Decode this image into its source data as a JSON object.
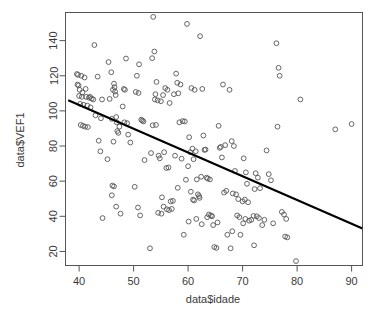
{
  "chart_data": {
    "type": "scatter",
    "title": "",
    "xlabel": "data$idade",
    "ylabel": "data$VEF1",
    "xlim": [
      37.5,
      92.0
    ],
    "ylim": [
      12.0,
      156.0
    ],
    "xticks": [
      40,
      50,
      60,
      70,
      80,
      90
    ],
    "yticks": [
      20,
      40,
      60,
      80,
      100,
      120,
      140
    ],
    "grid": false,
    "legend": null,
    "marker": {
      "shape": "open-circle",
      "radius": 2.4,
      "color": "#555555",
      "stroke_width": 0.9
    },
    "regression_line": {
      "x0": 38.0,
      "y0": 106.0,
      "x1": 92.0,
      "y1": 33.0,
      "color": "#000000",
      "width": 2.2,
      "slope": -1.352,
      "intercept": 157.4
    },
    "box": {
      "color": "#555555",
      "width": 1.0
    },
    "n_points": 201,
    "points": [
      [
        39.6,
        121.0
      ],
      [
        39.8,
        120.5
      ],
      [
        40.4,
        120.0
      ],
      [
        41.0,
        119.0
      ],
      [
        39.7,
        115.0
      ],
      [
        39.9,
        114.5
      ],
      [
        40.1,
        112.0
      ],
      [
        40.6,
        110.5
      ],
      [
        41.2,
        112.5
      ],
      [
        40.0,
        108.5
      ],
      [
        40.5,
        108.0
      ],
      [
        41.3,
        108.0
      ],
      [
        41.8,
        107.5
      ],
      [
        42.0,
        108.0
      ],
      [
        42.3,
        107.0
      ],
      [
        42.6,
        106.5
      ],
      [
        40.2,
        104.0
      ],
      [
        40.8,
        103.5
      ],
      [
        41.5,
        103.0
      ],
      [
        42.1,
        102.0
      ],
      [
        40.3,
        92.0
      ],
      [
        40.7,
        91.5
      ],
      [
        41.1,
        91.0
      ],
      [
        41.6,
        90.8
      ],
      [
        42.8,
        137.5
      ],
      [
        43.4,
        119.5
      ],
      [
        44.2,
        106.5
      ],
      [
        43.0,
        97.5
      ],
      [
        44.0,
        95.8
      ],
      [
        43.6,
        83.0
      ],
      [
        43.9,
        77.0
      ],
      [
        44.3,
        39.0
      ],
      [
        45.4,
        127.8
      ],
      [
        45.9,
        122.0
      ],
      [
        46.2,
        112.0
      ],
      [
        46.4,
        115.5
      ],
      [
        46.5,
        113.5
      ],
      [
        46.6,
        111.0
      ],
      [
        46.7,
        109.0
      ],
      [
        45.6,
        106.8
      ],
      [
        46.8,
        96.5
      ],
      [
        46.0,
        95.5
      ],
      [
        46.9,
        93.5
      ],
      [
        47.4,
        91.0
      ],
      [
        47.0,
        88.5
      ],
      [
        47.2,
        87.5
      ],
      [
        46.3,
        82.5
      ],
      [
        45.2,
        72.5
      ],
      [
        46.1,
        57.5
      ],
      [
        46.4,
        57.0
      ],
      [
        46.0,
        52.0
      ],
      [
        46.8,
        45.5
      ],
      [
        47.6,
        41.5
      ],
      [
        48.6,
        129.8
      ],
      [
        48.2,
        112.5
      ],
      [
        48.4,
        112.0
      ],
      [
        48.0,
        102.5
      ],
      [
        48.3,
        93.5
      ],
      [
        48.8,
        93.0
      ],
      [
        49.0,
        86.5
      ],
      [
        49.4,
        82.0
      ],
      [
        50.2,
        56.8
      ],
      [
        50.8,
        45.0
      ],
      [
        51.2,
        40.5
      ],
      [
        51.0,
        126.5
      ],
      [
        50.6,
        120.0
      ],
      [
        50.4,
        110.8
      ],
      [
        50.9,
        110.2
      ],
      [
        51.4,
        95.0
      ],
      [
        51.6,
        94.5
      ],
      [
        51.8,
        94.0
      ],
      [
        52.0,
        72.0
      ],
      [
        53.6,
        153.5
      ],
      [
        53.8,
        133.8
      ],
      [
        53.4,
        130.0
      ],
      [
        54.2,
        116.5
      ],
      [
        54.0,
        109.5
      ],
      [
        53.9,
        106.5
      ],
      [
        54.4,
        106.0
      ],
      [
        53.5,
        91.8
      ],
      [
        54.1,
        92.0
      ],
      [
        53.2,
        76.0
      ],
      [
        54.6,
        74.5
      ],
      [
        54.8,
        73.0
      ],
      [
        53.0,
        21.8
      ],
      [
        55.4,
        109.0
      ],
      [
        55.8,
        113.0
      ],
      [
        56.2,
        112.0
      ],
      [
        55.0,
        105.5
      ],
      [
        56.6,
        104.5
      ],
      [
        55.6,
        76.5
      ],
      [
        56.0,
        67.5
      ],
      [
        56.4,
        67.8
      ],
      [
        55.2,
        50.8
      ],
      [
        56.8,
        48.5
      ],
      [
        55.5,
        45.5
      ],
      [
        56.1,
        44.0
      ],
      [
        56.5,
        43.5
      ],
      [
        57.0,
        44.2
      ],
      [
        54.5,
        42.0
      ],
      [
        55.1,
        41.5
      ],
      [
        57.4,
        109.5
      ],
      [
        57.8,
        121.2
      ],
      [
        58.0,
        116.0
      ],
      [
        58.6,
        115.0
      ],
      [
        58.2,
        110.0
      ],
      [
        59.0,
        94.2
      ],
      [
        59.4,
        94.0
      ],
      [
        58.4,
        93.5
      ],
      [
        57.6,
        74.5
      ],
      [
        58.8,
        72.8
      ],
      [
        59.6,
        60.8
      ],
      [
        58.1,
        56.2
      ],
      [
        57.2,
        48.8
      ],
      [
        59.2,
        29.5
      ],
      [
        59.8,
        149.5
      ],
      [
        60.6,
        113.0
      ],
      [
        61.2,
        112.0
      ],
      [
        60.2,
        85.0
      ],
      [
        60.8,
        78.5
      ],
      [
        61.4,
        77.0
      ],
      [
        60.4,
        76.5
      ],
      [
        61.0,
        72.5
      ],
      [
        60.0,
        68.5
      ],
      [
        61.6,
        61.0
      ],
      [
        60.5,
        54.0
      ],
      [
        61.8,
        52.5
      ],
      [
        60.9,
        49.5
      ],
      [
        61.1,
        49.0
      ],
      [
        62.0,
        51.5
      ],
      [
        60.1,
        37.0
      ],
      [
        61.5,
        38.5
      ],
      [
        62.2,
        142.5
      ],
      [
        62.6,
        112.5
      ],
      [
        62.8,
        86.0
      ],
      [
        63.2,
        78.0
      ],
      [
        63.0,
        77.8
      ],
      [
        62.4,
        62.5
      ],
      [
        63.4,
        62.0
      ],
      [
        63.6,
        61.5
      ],
      [
        64.0,
        61.0
      ],
      [
        62.1,
        50.5
      ],
      [
        63.8,
        41.0
      ],
      [
        64.2,
        40.5
      ],
      [
        64.4,
        40.0
      ],
      [
        63.5,
        39.5
      ],
      [
        62.5,
        35.5
      ],
      [
        64.6,
        35.0
      ],
      [
        64.8,
        22.5
      ],
      [
        65.2,
        22.0
      ],
      [
        65.6,
        91.5
      ],
      [
        66.4,
        115.0
      ],
      [
        66.0,
        79.5
      ],
      [
        65.8,
        79.0
      ],
      [
        66.8,
        80.5
      ],
      [
        66.2,
        73.5
      ],
      [
        66.6,
        53.5
      ],
      [
        67.0,
        54.5
      ],
      [
        65.4,
        36.5
      ],
      [
        67.2,
        29.5
      ],
      [
        67.6,
        112.0
      ],
      [
        68.0,
        82.8
      ],
      [
        68.4,
        80.0
      ],
      [
        68.6,
        65.8
      ],
      [
        68.2,
        53.0
      ],
      [
        68.8,
        52.5
      ],
      [
        69.2,
        49.8
      ],
      [
        69.0,
        40.5
      ],
      [
        69.4,
        39.5
      ],
      [
        68.1,
        31.5
      ],
      [
        69.6,
        29.5
      ],
      [
        67.8,
        21.8
      ],
      [
        70.2,
        73.0
      ],
      [
        70.6,
        65.0
      ],
      [
        70.8,
        58.5
      ],
      [
        70.4,
        49.5
      ],
      [
        70.0,
        48.5
      ],
      [
        71.0,
        48.0
      ],
      [
        70.5,
        38.5
      ],
      [
        71.2,
        37.5
      ],
      [
        71.6,
        38.0
      ],
      [
        70.1,
        36.0
      ],
      [
        72.0,
        40.2
      ],
      [
        72.4,
        64.5
      ],
      [
        72.8,
        62.0
      ],
      [
        72.2,
        55.5
      ],
      [
        73.2,
        56.0
      ],
      [
        72.6,
        40.0
      ],
      [
        73.0,
        39.0
      ],
      [
        73.6,
        35.0
      ],
      [
        72.1,
        23.5
      ],
      [
        74.4,
        77.5
      ],
      [
        74.8,
        64.0
      ],
      [
        75.2,
        60.5
      ],
      [
        74.0,
        38.0
      ],
      [
        75.6,
        36.0
      ],
      [
        76.2,
        138.5
      ],
      [
        76.6,
        124.5
      ],
      [
        76.8,
        120.0
      ],
      [
        76.4,
        91.0
      ],
      [
        77.2,
        42.5
      ],
      [
        77.6,
        41.0
      ],
      [
        78.0,
        38.5
      ],
      [
        77.8,
        28.5
      ],
      [
        78.2,
        28.0
      ],
      [
        79.8,
        14.5
      ],
      [
        80.6,
        106.5
      ],
      [
        87.0,
        89.5
      ],
      [
        90.0,
        92.5
      ]
    ]
  },
  "axis_labels": {
    "x_title": "data$idade",
    "y_title": "data$VEF1"
  }
}
